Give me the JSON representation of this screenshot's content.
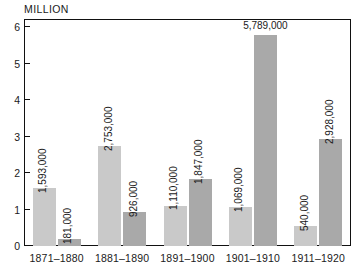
{
  "chart_data": {
    "type": "bar",
    "title": "",
    "subtitle": "",
    "unit_caption": "MILLION",
    "xlabel": "",
    "ylabel": "MILLION",
    "ylim": [
      0,
      6
    ],
    "y_ticks": [
      "0",
      "1",
      "2",
      "3",
      "4",
      "5",
      "6"
    ],
    "grid": false,
    "legend": "none",
    "categories": [
      "1871–1880",
      "1881–1890",
      "1891–1900",
      "1901–1910",
      "1911–1920"
    ],
    "series": [
      {
        "name": "series-light",
        "color": "#c9c9c9",
        "values": [
          1593000,
          2753000,
          1110000,
          1069000,
          540000
        ],
        "labels": [
          "1,593,000",
          "2,753,000",
          "1,110,000",
          "1,069,000",
          "540,000"
        ]
      },
      {
        "name": "series-dark",
        "color": "#a9a9a9",
        "values": [
          181000,
          926000,
          1847000,
          5789000,
          2928000
        ],
        "labels": [
          "181,000",
          "926,000",
          "1,847,000",
          "5,789,000",
          "2,928,000"
        ]
      }
    ]
  },
  "colors": {
    "light_bar": "#c9c9c9",
    "dark_bar": "#a9a9a9",
    "axis": "#111111",
    "text": "#1a1a1a",
    "background": "#ffffff"
  }
}
